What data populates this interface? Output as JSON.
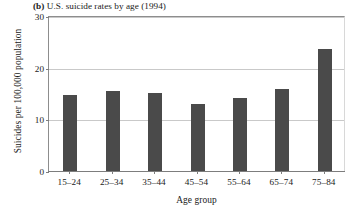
{
  "figure": {
    "panel_letter": "(b)",
    "title": "U.S. suicide rates by age (1994)"
  },
  "chart_data": {
    "type": "bar",
    "title": "U.S. suicide rates by age (1994)",
    "xlabel": "Age group",
    "ylabel": "Suicides per 100,000 population",
    "categories": [
      "15–24",
      "25–34",
      "35–44",
      "45–54",
      "55–64",
      "65–74",
      "75–84"
    ],
    "values": [
      14.9,
      15.7,
      15.2,
      13.1,
      14.4,
      16.0,
      23.8
    ],
    "ylim": [
      0,
      30
    ],
    "yticks": [
      0,
      10,
      20,
      30
    ],
    "ytick_labels": [
      "0",
      "10",
      "20",
      "30"
    ],
    "grid": "horizontal",
    "legend": "none",
    "bar_color": "#4a4a4a",
    "gridline_color": "#c9c9c9",
    "axis_color": "#7d7d7d"
  }
}
